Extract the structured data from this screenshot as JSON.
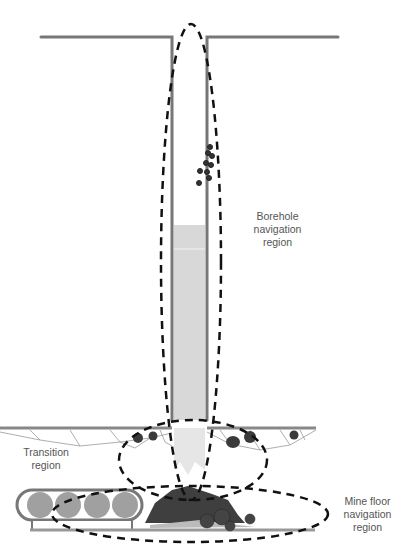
{
  "labels": {
    "borehole": [
      "Borehole",
      "navigation",
      "region"
    ],
    "transition": [
      "Transition",
      "region"
    ],
    "mine_floor": [
      "Mine floor",
      "navigation",
      "region"
    ]
  },
  "colors": {
    "wall": "#777777",
    "fill": "#d8d8d8",
    "dash": "#111111",
    "rock": "#3a3a3a",
    "pile": "#4a4a4a",
    "conveyor_roller": "#a0a0a0"
  }
}
